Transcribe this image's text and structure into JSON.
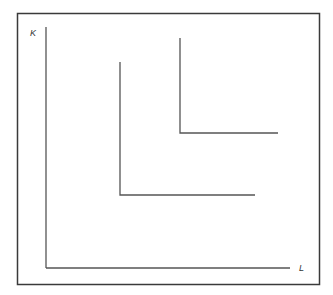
{
  "diagram": {
    "type": "isoquant-map",
    "axes": {
      "y_label": "K",
      "x_label": "L"
    },
    "colors": {
      "border": "#3a3a3a",
      "axis": "#555555",
      "curve": "#555555"
    },
    "curves": [
      {
        "name": "lower-isoquant",
        "shape": "L",
        "corner": [
          120,
          195
        ],
        "top": [
          120,
          62
        ],
        "right": [
          255,
          195
        ]
      },
      {
        "name": "upper-isoquant",
        "shape": "L",
        "corner": [
          180,
          133
        ],
        "top": [
          180,
          38
        ],
        "right": [
          278,
          133
        ]
      }
    ]
  }
}
